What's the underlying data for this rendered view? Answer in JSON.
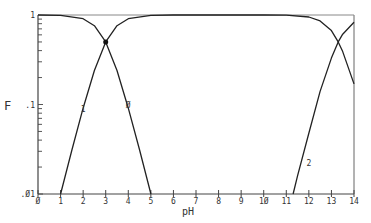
{
  "chart_data": {
    "type": "line",
    "title": "",
    "xlabel": "pH",
    "ylabel": "F",
    "xlim": [
      0,
      14
    ],
    "ylim": [
      0.01,
      1
    ],
    "yscale": "log",
    "grid": false,
    "legend": "inline curve labels",
    "x_ticks": [
      0,
      1,
      2,
      3,
      4,
      5,
      6,
      7,
      8,
      9,
      10,
      11,
      12,
      13,
      14
    ],
    "x_tick_labels": [
      "Ø",
      "1",
      "2",
      "3",
      "4",
      "5",
      "6",
      "7",
      "8",
      "9",
      "1Ø",
      "11",
      "12",
      "13",
      "14"
    ],
    "y_tick_labels": [
      ".Ø1",
      ".1",
      "1"
    ],
    "y_ticks": [
      0.01,
      0.1,
      1
    ],
    "pKa": [
      3.0,
      13.3
    ],
    "series": [
      {
        "name": "Ø",
        "label_at": {
          "x": 4.0,
          "y": 0.1
        },
        "x": [
          0,
          1,
          2,
          2.5,
          3,
          3.5,
          4,
          4.5,
          5
        ],
        "values": [
          1.0,
          0.99,
          0.91,
          0.76,
          0.5,
          0.24,
          0.091,
          0.031,
          0.01
        ]
      },
      {
        "name": "1",
        "label_at": {
          "x": 2.0,
          "y": 0.09
        },
        "x": [
          1,
          1.5,
          2,
          2.5,
          3,
          3.5,
          4,
          5,
          6,
          8,
          10,
          11,
          12,
          12.5,
          13,
          13.3,
          13.5,
          14
        ],
        "values": [
          0.01,
          0.031,
          0.091,
          0.24,
          0.5,
          0.76,
          0.91,
          0.99,
          1.0,
          1.0,
          1.0,
          0.995,
          0.95,
          0.86,
          0.67,
          0.5,
          0.39,
          0.17
        ]
      },
      {
        "name": "2",
        "label_at": {
          "x": 12.0,
          "y": 0.022
        },
        "x": [
          11.3,
          11.5,
          12,
          12.5,
          13,
          13.3,
          13.5,
          14
        ],
        "values": [
          0.01,
          0.016,
          0.048,
          0.14,
          0.33,
          0.5,
          0.61,
          0.83
        ]
      }
    ],
    "markers": [
      {
        "x": 3.0,
        "y": 0.5,
        "shape": "filled-dot"
      }
    ]
  },
  "axis": {
    "x_title": "pH",
    "y_title": "F"
  }
}
